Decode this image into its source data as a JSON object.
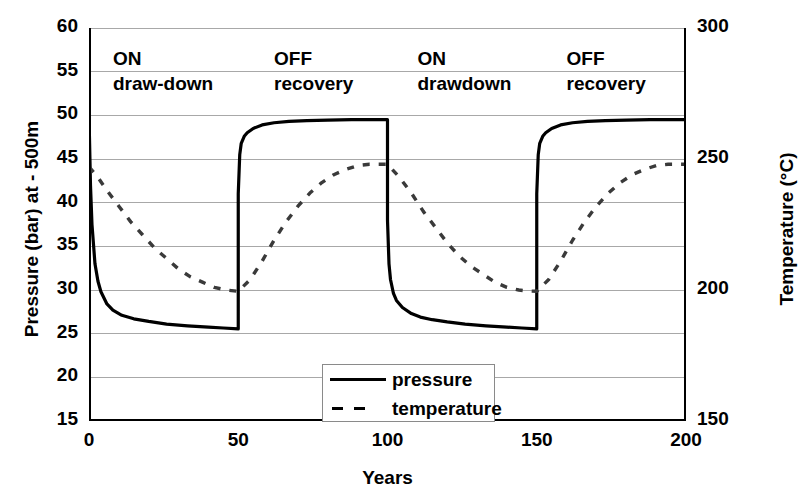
{
  "chart_data": {
    "type": "line",
    "title": "",
    "xlabel": "Years",
    "ylabel": "Pressure (bar) at - 500m",
    "ylabel_right": "Temperature (°C)",
    "xlim": [
      0,
      200
    ],
    "ylim": [
      15,
      60
    ],
    "ylim_right": [
      150,
      300
    ],
    "xticks": [
      "0",
      "50",
      "100",
      "150",
      "200"
    ],
    "xtick_values": [
      0,
      50,
      100,
      150,
      200
    ],
    "yticks_left": [
      "60",
      "55",
      "50",
      "45",
      "40",
      "35",
      "30",
      "25",
      "20",
      "15"
    ],
    "ytick_values_left": [
      60,
      55,
      50,
      45,
      40,
      35,
      30,
      25,
      20,
      15
    ],
    "yticks_right": [
      "300",
      "250",
      "200",
      "150"
    ],
    "ytick_values_right": [
      300,
      250,
      200,
      150
    ],
    "grid": true,
    "grid_color": "#a8a8a8",
    "legend_position": "inside-bottom-center",
    "series": [
      {
        "name": "pressure",
        "style": "solid",
        "color": "#000000",
        "axis": "left",
        "units": "bar",
        "x": [
          0,
          0.5,
          1,
          2,
          3,
          4,
          6,
          8,
          11,
          15,
          20,
          26,
          33,
          40,
          45,
          50,
          50,
          50.5,
          51,
          52,
          53,
          55,
          58,
          62,
          67,
          73,
          80,
          88,
          95,
          100,
          100,
          100.5,
          101,
          102,
          103,
          105,
          108,
          111,
          115,
          120,
          126,
          133,
          140,
          145,
          150,
          150,
          150.5,
          151,
          152,
          153,
          155,
          158,
          162,
          167,
          173,
          180,
          188,
          195,
          200
        ],
        "y": [
          50.0,
          42.0,
          37.5,
          33.0,
          31.0,
          29.8,
          28.4,
          27.7,
          27.1,
          26.7,
          26.4,
          26.1,
          25.9,
          25.75,
          25.65,
          25.55,
          41.0,
          45.5,
          46.8,
          47.6,
          48.0,
          48.5,
          48.9,
          49.15,
          49.3,
          49.4,
          49.45,
          49.5,
          49.5,
          49.5,
          38.0,
          33.0,
          31.2,
          29.6,
          28.8,
          28.0,
          27.3,
          26.9,
          26.6,
          26.35,
          26.1,
          25.9,
          25.75,
          25.65,
          25.55,
          41.0,
          45.5,
          46.8,
          47.6,
          48.0,
          48.5,
          48.9,
          49.15,
          49.3,
          49.4,
          49.45,
          49.5,
          49.5,
          49.5
        ]
      },
      {
        "name": "temperature",
        "style": "dashed",
        "color": "#3a3a3a",
        "axis": "right",
        "units": "°C",
        "x": [
          0,
          3,
          6,
          10,
          14,
          18,
          22,
          26,
          30,
          34,
          38,
          42,
          46,
          50,
          50,
          54,
          58,
          62,
          66,
          70,
          74,
          78,
          82,
          86,
          90,
          94,
          97,
          100,
          100,
          104,
          108,
          112,
          116,
          120,
          124,
          128,
          132,
          136,
          140,
          144,
          147,
          150,
          150,
          154,
          158,
          162,
          166,
          170,
          174,
          178,
          182,
          186,
          190,
          194,
          197,
          200
        ],
        "y": [
          247,
          243,
          238,
          232,
          226,
          221,
          216,
          212,
          208,
          205,
          203,
          201,
          200,
          199.5,
          199.5,
          204,
          211,
          219,
          226,
          232,
          237,
          241,
          244,
          246,
          247.5,
          248,
          248,
          248,
          248,
          243,
          237,
          230,
          224,
          218,
          213,
          209,
          206,
          203,
          201,
          200,
          199.6,
          199.5,
          199.5,
          204,
          211,
          219,
          226,
          232,
          237,
          241,
          244,
          246,
          247.5,
          248,
          248,
          248
        ]
      }
    ],
    "annotations": [
      {
        "name": "phase-1",
        "line1": "ON",
        "line2": "draw-down",
        "x": 8,
        "y": 56.5
      },
      {
        "name": "phase-2",
        "line1": "OFF",
        "line2": "recovery",
        "x": 62,
        "y": 56.5
      },
      {
        "name": "phase-3",
        "line1": "ON",
        "line2": "drawdown",
        "x": 110,
        "y": 56.5
      },
      {
        "name": "phase-4",
        "line1": "OFF",
        "line2": "recovery",
        "x": 160,
        "y": 56.5
      }
    ],
    "legend_entries": [
      {
        "label": "pressure",
        "style": "solid"
      },
      {
        "label": "temperature",
        "style": "dashed"
      }
    ]
  }
}
